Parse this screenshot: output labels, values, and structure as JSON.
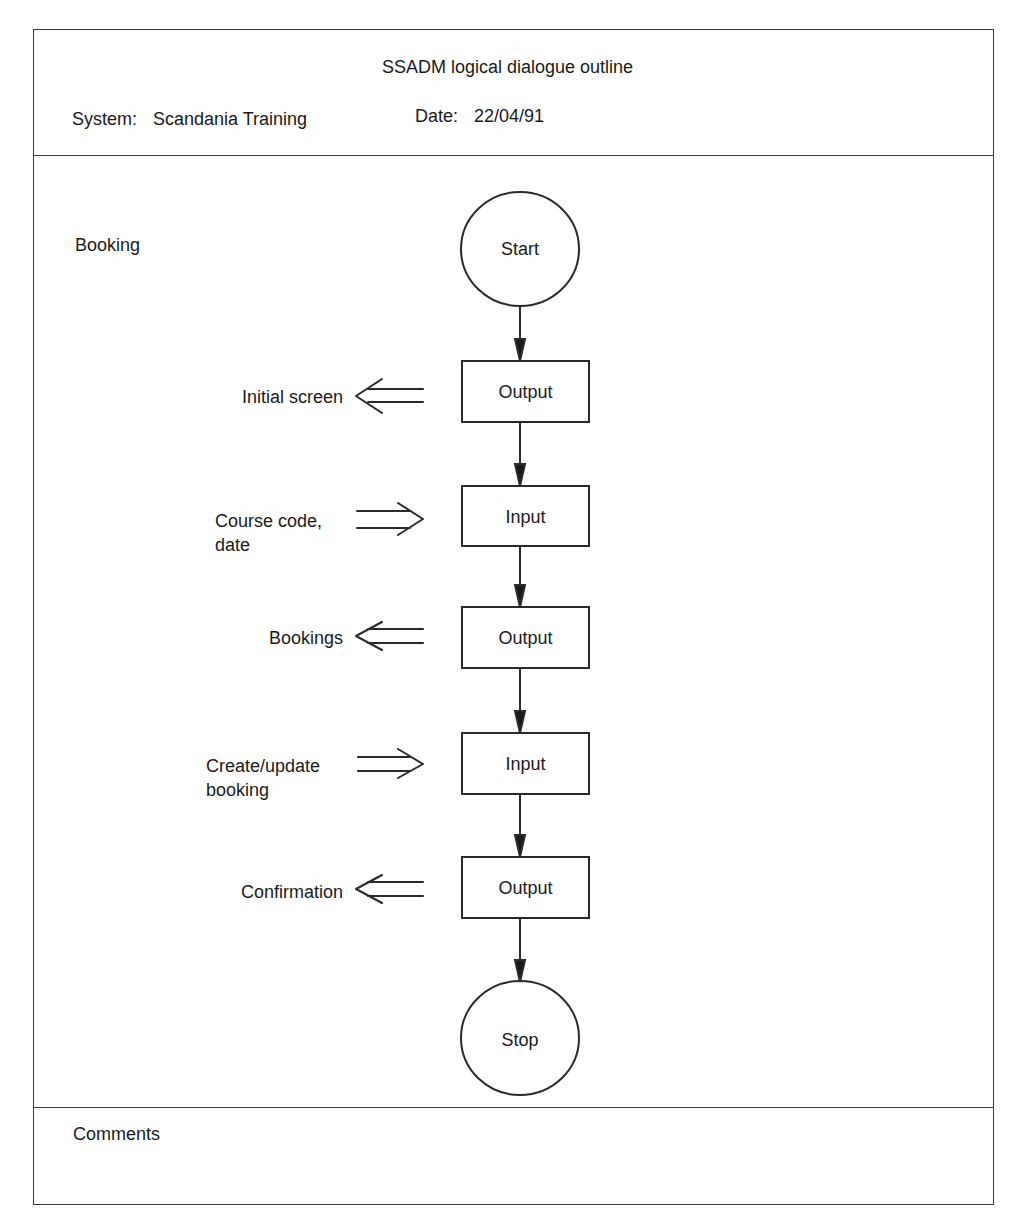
{
  "header": {
    "title": "SSADM logical dialogue outline",
    "system_label": "System:",
    "system_value": "Scandania Training",
    "date_label": "Date:",
    "date_value": "22/04/91"
  },
  "body": {
    "section_label": "Booking",
    "start_node": "Start",
    "stop_node": "Stop",
    "steps": [
      {
        "type": "Output",
        "data_label": "Initial screen",
        "direction": "out"
      },
      {
        "type": "Input",
        "data_label": "Course code,\ndate",
        "direction": "in"
      },
      {
        "type": "Output",
        "data_label": "Bookings",
        "direction": "out"
      },
      {
        "type": "Input",
        "data_label": "Create/update\nbooking",
        "direction": "in"
      },
      {
        "type": "Output",
        "data_label": "Confirmation",
        "direction": "out"
      }
    ]
  },
  "footer": {
    "comments_label": "Comments",
    "comments_value": ""
  },
  "colors": {
    "ink": "#1a1a1a",
    "line": "#2a2a2a",
    "paper": "#ffffff"
  }
}
